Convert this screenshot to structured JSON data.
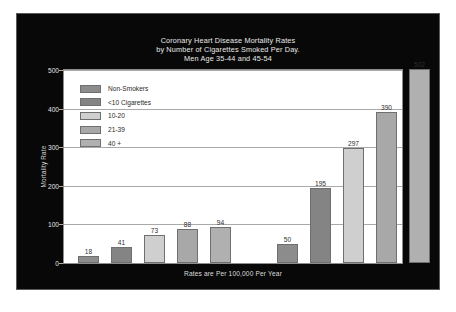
{
  "chart_data": {
    "type": "bar",
    "title": "Coronary Heart Disease Mortality Rates\nby Number of Cigarettes Smoked Per Day.\nMen Age 35-44 and 45-54",
    "title_lines": [
      "Coronary Heart Disease Mortality Rates",
      "by Number of Cigarettes Smoked Per Day.",
      "Men Age 35-44 and 45-54"
    ],
    "footnote": "Rates are Per 100,000 Per Year",
    "xlabel": "",
    "ylabel": "Mortality Rate",
    "ylim": [
      0,
      500
    ],
    "yticks": [
      0,
      100,
      200,
      300,
      400,
      500
    ],
    "ytick_labels": [
      "0",
      "100",
      "200",
      "300",
      "400",
      "500"
    ],
    "grid": true,
    "legend_position": "upper-left-inside",
    "categories": [
      "Men Age 35-44",
      "Men Age 45-54"
    ],
    "series": [
      {
        "name": "Non-Smokers",
        "values": [
          18,
          50
        ],
        "color": "#8c8c8c"
      },
      {
        "name": "<10 Cigarettes",
        "values": [
          41,
          195
        ],
        "color": "#848484"
      },
      {
        "name": "10-20",
        "values": [
          73,
          297
        ],
        "color": "#cfcfcf"
      },
      {
        "name": "21-39",
        "values": [
          88,
          390
        ],
        "color": "#a8a8a8"
      },
      {
        "name": "40 +",
        "values": [
          94,
          502
        ],
        "color": "#b0b0b0"
      }
    ],
    "bars": [
      {
        "label": "18",
        "value": 18,
        "series": "Non-Smokers",
        "group": "Men Age 35-44",
        "color": "#8c8c8c"
      },
      {
        "label": "41",
        "value": 41,
        "series": "<10 Cigarettes",
        "group": "Men Age 35-44",
        "color": "#848484"
      },
      {
        "label": "73",
        "value": 73,
        "series": "10-20",
        "group": "Men Age 35-44",
        "color": "#cfcfcf"
      },
      {
        "label": "88",
        "value": 88,
        "series": "21-39",
        "group": "Men Age 35-44",
        "color": "#a8a8a8"
      },
      {
        "label": "94",
        "value": 94,
        "series": "40 +",
        "group": "Men Age 35-44",
        "color": "#b0b0b0"
      },
      {
        "label": "50",
        "value": 50,
        "series": "Non-Smokers",
        "group": "Men Age 45-54",
        "color": "#8c8c8c"
      },
      {
        "label": "195",
        "value": 195,
        "series": "<10 Cigarettes",
        "group": "Men Age 45-54",
        "color": "#848484"
      },
      {
        "label": "297",
        "value": 297,
        "series": "10-20",
        "group": "Men Age 45-54",
        "color": "#cfcfcf"
      },
      {
        "label": "390",
        "value": 390,
        "series": "21-39",
        "group": "Men Age 45-54",
        "color": "#a8a8a8"
      },
      {
        "label": "502",
        "value": 502,
        "series": "40 +",
        "group": "Men Age 45-54",
        "color": "#b0b0b0"
      }
    ]
  },
  "style": {
    "panel_background": "#080808",
    "plot_background": "#ffffff",
    "grid_color": "#a9a9a9",
    "text_color": "#e6e6e6",
    "legend_text_color": "#2a2a2a",
    "bar_border_color": "#6f6f6f"
  }
}
